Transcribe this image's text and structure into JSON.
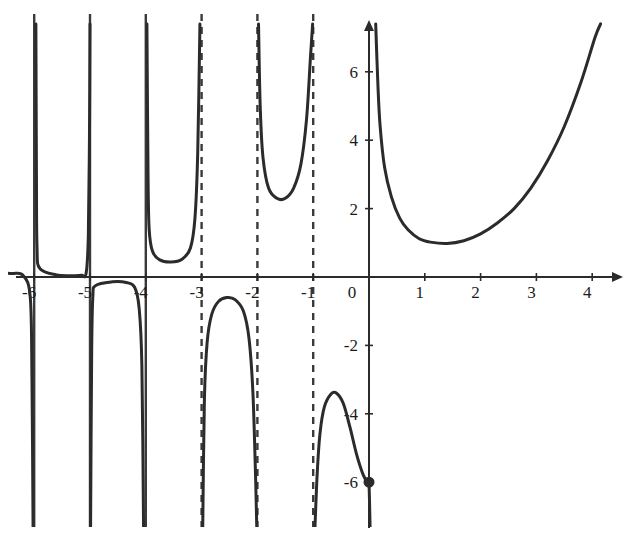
{
  "chart_data": {
    "type": "line",
    "title": "",
    "subtitle": "",
    "xlabel": "",
    "ylabel": "",
    "xlim": [
      -6.6,
      4.6
    ],
    "ylim": [
      -7.4,
      7.4
    ],
    "grid": false,
    "legend": null,
    "x_ticks": [
      -6,
      -5,
      -4,
      -3,
      -2,
      -1,
      0,
      1,
      2,
      3,
      4
    ],
    "x_tick_labels": [
      "-6",
      "-5",
      "-4",
      "-3",
      "-2",
      "-1",
      "0",
      "1",
      "2",
      "3",
      "4"
    ],
    "y_ticks": [
      -6,
      -4,
      -2,
      2,
      4,
      6
    ],
    "y_tick_labels": [
      "-6",
      "-4",
      "-2",
      "2",
      "4",
      "6"
    ],
    "origin_label": "0",
    "colors": {
      "curve": "#2b2b2b",
      "axis": "#2b2b2b",
      "asymptote": "#3a3a3a",
      "background": "#ffffff",
      "tick_text": "#1c1c1c"
    },
    "asymptotes": [
      {
        "x": -6,
        "style": "solid"
      },
      {
        "x": -5,
        "style": "solid"
      },
      {
        "x": -4,
        "style": "solid"
      },
      {
        "x": -3,
        "style": "dashed"
      },
      {
        "x": -2,
        "style": "dashed"
      },
      {
        "x": -1,
        "style": "dashed"
      }
    ],
    "marked_points": [
      {
        "x": 0,
        "y": -6,
        "style": "filled"
      }
    ],
    "branches": [
      {
        "name": "branch-left-of-minus6",
        "x_range": [
          -6.6,
          -6.0
        ],
        "points": [
          [
            -6.6,
            0.12
          ],
          [
            -6.4,
            0.1
          ],
          [
            -6.2,
            0.05
          ],
          [
            -6.07,
            -0.6
          ],
          [
            -6.04,
            -3.0
          ],
          [
            -6.02,
            -7.4
          ]
        ]
      },
      {
        "name": "branch-minus6-to-minus5-upper",
        "x_range": [
          -6.0,
          -5.0
        ],
        "points": [
          [
            -5.97,
            7.4
          ],
          [
            -5.96,
            3.0
          ],
          [
            -5.95,
            0.9
          ],
          [
            -5.9,
            0.25
          ],
          [
            -5.6,
            0.06
          ],
          [
            -5.3,
            0.04
          ],
          [
            -5.15,
            0.05
          ],
          [
            -5.07,
            0.1
          ],
          [
            -5.03,
            1.2
          ],
          [
            -5.01,
            4.0
          ],
          [
            -5.0,
            7.4
          ]
        ]
      },
      {
        "name": "branch-minus5-to-minus4-lower",
        "x_range": [
          -5.0,
          -4.0
        ],
        "points": [
          [
            -4.99,
            -7.4
          ],
          [
            -4.97,
            -2.2
          ],
          [
            -4.95,
            -0.6
          ],
          [
            -4.9,
            -0.25
          ],
          [
            -4.6,
            -0.14
          ],
          [
            -4.35,
            -0.16
          ],
          [
            -4.2,
            -0.3
          ],
          [
            -4.12,
            -0.9
          ],
          [
            -4.07,
            -2.6
          ],
          [
            -4.04,
            -7.4
          ]
        ]
      },
      {
        "name": "branch-minus4-to-minus3-upper",
        "x_range": [
          -4.0,
          -3.0
        ],
        "points": [
          [
            -3.98,
            7.4
          ],
          [
            -3.96,
            3.0
          ],
          [
            -3.94,
            1.4
          ],
          [
            -3.88,
            0.75
          ],
          [
            -3.75,
            0.5
          ],
          [
            -3.55,
            0.44
          ],
          [
            -3.35,
            0.52
          ],
          [
            -3.2,
            0.85
          ],
          [
            -3.12,
            1.7
          ],
          [
            -3.07,
            3.6
          ],
          [
            -3.03,
            7.4
          ]
        ]
      },
      {
        "name": "branch-minus3-to-minus2-lower",
        "x_range": [
          -3.0,
          -2.0
        ],
        "points": [
          [
            -2.98,
            -7.4
          ],
          [
            -2.95,
            -3.6
          ],
          [
            -2.9,
            -1.9
          ],
          [
            -2.82,
            -1.1
          ],
          [
            -2.7,
            -0.72
          ],
          [
            -2.55,
            -0.6
          ],
          [
            -2.4,
            -0.66
          ],
          [
            -2.25,
            -1.0
          ],
          [
            -2.15,
            -1.8
          ],
          [
            -2.08,
            -3.4
          ],
          [
            -2.03,
            -6.0
          ],
          [
            -2.01,
            -7.4
          ]
        ]
      },
      {
        "name": "branch-minus2-to-minus1-upper",
        "x_range": [
          -2.0,
          -1.0
        ],
        "points": [
          [
            -1.98,
            7.4
          ],
          [
            -1.95,
            5.0
          ],
          [
            -1.9,
            3.5
          ],
          [
            -1.8,
            2.6
          ],
          [
            -1.65,
            2.3
          ],
          [
            -1.5,
            2.3
          ],
          [
            -1.35,
            2.6
          ],
          [
            -1.22,
            3.3
          ],
          [
            -1.12,
            4.6
          ],
          [
            -1.05,
            6.4
          ],
          [
            -1.01,
            7.4
          ]
        ]
      },
      {
        "name": "branch-minus1-to-zero-lower",
        "x_range": [
          -1.0,
          0.0
        ],
        "points": [
          [
            -0.97,
            -7.4
          ],
          [
            -0.93,
            -5.8
          ],
          [
            -0.88,
            -4.6
          ],
          [
            -0.8,
            -3.8
          ],
          [
            -0.68,
            -3.42
          ],
          [
            -0.58,
            -3.4
          ],
          [
            -0.46,
            -3.7
          ],
          [
            -0.34,
            -4.4
          ],
          [
            -0.22,
            -5.2
          ],
          [
            -0.1,
            -5.8
          ],
          [
            -0.02,
            -6.0
          ],
          [
            0.0,
            -6.0
          ]
        ]
      },
      {
        "name": "branch-zero-descending",
        "x_range": [
          0.0,
          0.05
        ],
        "points": [
          [
            0.0,
            -6.0
          ],
          [
            0.01,
            -6.6
          ],
          [
            0.02,
            -7.4
          ]
        ]
      },
      {
        "name": "branch-right-of-zero",
        "x_range": [
          0.1,
          4.2
        ],
        "points": [
          [
            0.12,
            7.4
          ],
          [
            0.16,
            5.6
          ],
          [
            0.2,
            4.4
          ],
          [
            0.28,
            3.2
          ],
          [
            0.4,
            2.35
          ],
          [
            0.55,
            1.72
          ],
          [
            0.7,
            1.38
          ],
          [
            0.9,
            1.12
          ],
          [
            1.1,
            1.02
          ],
          [
            1.4,
            0.98
          ],
          [
            1.7,
            1.06
          ],
          [
            2.0,
            1.26
          ],
          [
            2.3,
            1.58
          ],
          [
            2.6,
            2.0
          ],
          [
            2.9,
            2.6
          ],
          [
            3.2,
            3.4
          ],
          [
            3.5,
            4.4
          ],
          [
            3.8,
            5.7
          ],
          [
            4.05,
            7.0
          ],
          [
            4.15,
            7.4
          ]
        ]
      }
    ]
  },
  "figure": {
    "alt_description": "Graph with vertical asymptotes and multiple branches"
  }
}
